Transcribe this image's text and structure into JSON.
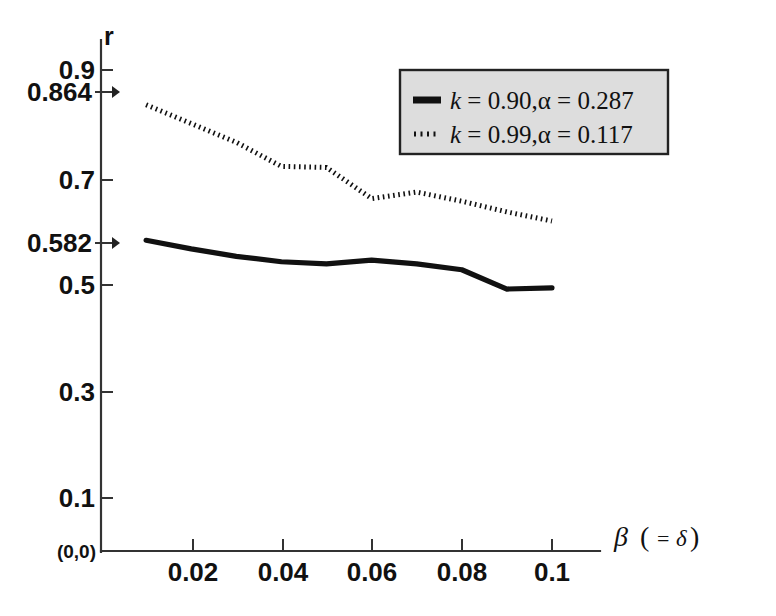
{
  "chart_data": {
    "type": "line",
    "title": "",
    "subtitle": "",
    "xlabel": "β ( =δ)",
    "ylabel": "r",
    "xlim": [
      0,
      0.11
    ],
    "ylim": [
      0,
      0.95
    ],
    "grid": false,
    "legend_position": "top-right",
    "x": [
      0.01,
      0.02,
      0.03,
      0.04,
      0.05,
      0.06,
      0.07,
      0.08,
      0.09,
      0.1
    ],
    "xticks": [
      "0.02",
      "0.04",
      "0.06",
      "0.08",
      "0.1"
    ],
    "xtick_values": [
      0.02,
      0.04,
      0.06,
      0.08,
      0.1
    ],
    "yticks": [
      "0.9",
      "0.864",
      "0.7",
      "0.582",
      "0.5",
      "0.3",
      "0.1"
    ],
    "ytick_values": [
      0.9,
      0.864,
      0.7,
      0.582,
      0.5,
      0.3,
      0.1
    ],
    "origin_label": "(0,0)",
    "highlighted_yticks": [
      "0.864",
      "0.582"
    ],
    "series": [
      {
        "name": "k=0.90,α=0.287",
        "style": "solid",
        "k": "0.90",
        "alpha": "0.287",
        "values": [
          0.582,
          0.566,
          0.552,
          0.542,
          0.538,
          0.545,
          0.538,
          0.527,
          0.491,
          0.493
        ]
      },
      {
        "name": "k=0.99,α=0.117",
        "style": "dotted",
        "k": "0.99",
        "alpha": "0.117",
        "values": [
          0.835,
          0.8,
          0.765,
          0.72,
          0.718,
          0.66,
          0.672,
          0.655,
          0.635,
          0.618
        ]
      }
    ]
  },
  "legend": {
    "entries": [
      {
        "prefix": "k",
        "eq1": " = ",
        "k_value": "0.90",
        "comma": ",",
        "alpha": "α",
        "eq2": " = ",
        "alpha_value": "0.287",
        "full": "k = 0.90,α = 0.287"
      },
      {
        "prefix": "k",
        "eq1": " = ",
        "k_value": "0.99",
        "comma": ",",
        "alpha": "α",
        "eq2": " = ",
        "alpha_value": "0.117",
        "full": "k = 0.99,α = 0.117"
      }
    ]
  },
  "axes": {
    "y_label": "r",
    "x_label_beta": "β",
    "x_label_paren_open": "(",
    "x_label_eq": "=",
    "x_label_delta": "δ",
    "x_label_paren_close": ")",
    "origin": "(0,0)"
  },
  "colors": {
    "line": "#111111",
    "axis": "#333333",
    "legend_fill": "#dddddd",
    "legend_border": "#222222",
    "background": "#ffffff"
  }
}
